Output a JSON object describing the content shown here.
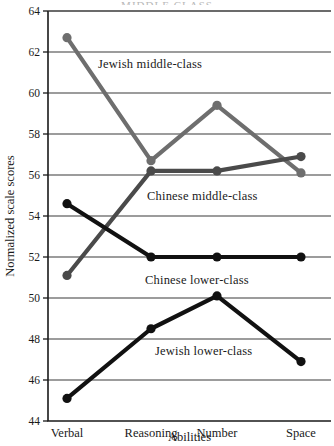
{
  "chart_data": {
    "type": "line",
    "title": "",
    "top_cropped_text": "MIDDLE CLASS",
    "xlabel": "Abilities",
    "ylabel": "Normalized scale scores",
    "categories": [
      "Verbal",
      "Reasoning",
      "Number",
      "Space"
    ],
    "ylim": [
      44,
      64
    ],
    "yticks": [
      44,
      46,
      48,
      50,
      52,
      54,
      56,
      58,
      60,
      62,
      64
    ],
    "ytick_labels": [
      "44",
      "46",
      "48",
      "50",
      "52",
      "54",
      "56",
      "58",
      "60",
      "62",
      "64"
    ],
    "grid": true,
    "grid_axis": "y",
    "legend_position": "inline-annotations",
    "series": [
      {
        "name": "Jewish middle-class",
        "color": "#6e6e6e",
        "values": [
          62.7,
          56.7,
          59.4,
          56.1
        ],
        "label_x_category": "Reasoning",
        "label_y_value": 61.4
      },
      {
        "name": "Chinese middle-class",
        "color": "#4a4a4a",
        "values": [
          51.1,
          56.2,
          56.2,
          56.9
        ],
        "label_x_category": "Reasoning",
        "label_y_value": 55.0
      },
      {
        "name": "Chinese lower-class",
        "color": "#111111",
        "values": [
          54.6,
          52.0,
          52.0,
          52.0
        ],
        "label_x_category": "Reasoning",
        "label_y_value": 50.9
      },
      {
        "name": "Jewish lower-class",
        "color": "#111111",
        "values": [
          45.1,
          48.5,
          50.1,
          46.9
        ],
        "label_x_category": "Reasoning",
        "label_y_value": 47.4
      }
    ]
  }
}
